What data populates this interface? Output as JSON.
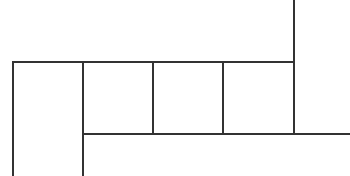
{
  "diagram": {
    "type": "grid-line-figure",
    "stroke_color": "#333333",
    "background": "#ffffff",
    "stroke_width": 2,
    "lines": [
      {
        "id": "top-horizontal",
        "x1": 13,
        "y1": 62,
        "x2": 294,
        "y2": 62
      },
      {
        "id": "bottom-horizontal",
        "x1": 83,
        "y1": 134,
        "x2": 350,
        "y2": 134
      },
      {
        "id": "left-vertical",
        "x1": 13,
        "y1": 62,
        "x2": 13,
        "y2": 176
      },
      {
        "id": "second-vertical",
        "x1": 83,
        "y1": 62,
        "x2": 83,
        "y2": 176
      },
      {
        "id": "third-vertical",
        "x1": 153,
        "y1": 62,
        "x2": 153,
        "y2": 134
      },
      {
        "id": "fourth-vertical",
        "x1": 223,
        "y1": 62,
        "x2": 223,
        "y2": 134
      },
      {
        "id": "right-vertical",
        "x1": 294,
        "y1": 0,
        "x2": 294,
        "y2": 134
      }
    ],
    "cells": [
      {
        "id": "tall-left-cell",
        "x": 13,
        "y": 62,
        "w": 70,
        "h": 114
      },
      {
        "id": "square-1",
        "x": 83,
        "y": 62,
        "w": 70,
        "h": 72
      },
      {
        "id": "square-2",
        "x": 153,
        "y": 62,
        "w": 70,
        "h": 72
      },
      {
        "id": "square-3",
        "x": 223,
        "y": 62,
        "w": 71,
        "h": 72
      }
    ]
  }
}
